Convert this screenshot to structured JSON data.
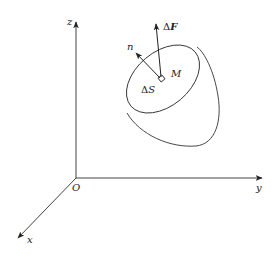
{
  "diagram": {
    "type": "3d-coordinate-surface-force",
    "axes": {
      "origin_label": "O",
      "x_label": "x",
      "y_label": "y",
      "z_label": "z"
    },
    "surface": {
      "point_label": "M",
      "area_element_label": "ΔS",
      "area_delta": "Δ",
      "area_symbol": "S"
    },
    "vectors": {
      "normal_label": "n",
      "force_delta": "Δ",
      "force_symbol": "F"
    },
    "colors": {
      "line": "#333333",
      "background": "#ffffff"
    }
  }
}
